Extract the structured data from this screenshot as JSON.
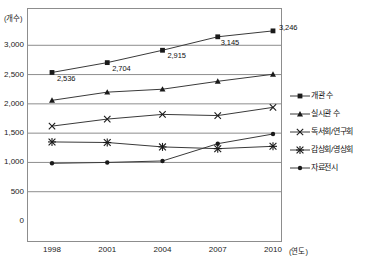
{
  "chart_data": {
    "type": "line",
    "title": "",
    "xlabel": "(연도)",
    "ylabel": "(개수)",
    "x": [
      "1998",
      "2001",
      "2004",
      "2007",
      "2010"
    ],
    "categories": [
      "1998",
      "2001",
      "2004",
      "2007",
      "2010"
    ],
    "ylim": [
      0,
      3500
    ],
    "ytick_labels": [
      "3,000",
      "2,500",
      "2,000",
      "1,500",
      "1,000",
      "500",
      "0"
    ],
    "ytick_values": [
      3000,
      2500,
      2000,
      1500,
      1000,
      500,
      0
    ],
    "grid": true,
    "legend_position": "right",
    "series": [
      {
        "name": "개관 수",
        "marker": "square",
        "values": [
          2536,
          2704,
          2915,
          3145,
          3246
        ],
        "point_labels": [
          "2,536",
          "2,704",
          "2,915",
          "3,145",
          "3,246"
        ]
      },
      {
        "name": "실시관 수",
        "marker": "triangle",
        "values": [
          2060,
          2200,
          2250,
          2385,
          2505
        ],
        "point_labels": [
          "",
          "",
          "",
          "",
          ""
        ]
      },
      {
        "name": "독서회/연구회",
        "marker": "x",
        "values": [
          1620,
          1740,
          1820,
          1800,
          1940
        ],
        "point_labels": [
          "",
          "",
          "",
          "",
          ""
        ]
      },
      {
        "name": "감상회/영상회",
        "marker": "asterisk",
        "values": [
          1350,
          1340,
          1265,
          1235,
          1275
        ],
        "point_labels": [
          "",
          "",
          "",
          "",
          ""
        ]
      },
      {
        "name": "자료전시",
        "marker": "dot",
        "values": [
          985,
          1000,
          1025,
          1320,
          1485
        ],
        "point_labels": [
          "",
          "",
          "",
          "",
          ""
        ]
      }
    ]
  },
  "axis": {
    "y_unit": "(개수)",
    "x_unit": "(연도)",
    "y_ticks": [
      "3,000",
      "2,500",
      "2,000",
      "1,500",
      "1,000",
      "500",
      "0"
    ],
    "x_ticks": [
      "1998",
      "2001",
      "2004",
      "2007",
      "2010"
    ]
  },
  "legend": {
    "items": [
      {
        "label": "개관 수"
      },
      {
        "label": "실시관 수"
      },
      {
        "label": "독서회/연구회"
      },
      {
        "label": "감상회/영상회"
      },
      {
        "label": "자료전시"
      }
    ]
  },
  "data_labels": {
    "series1": [
      "2,536",
      "2,704",
      "2,915",
      "3,145",
      "3,246"
    ]
  }
}
